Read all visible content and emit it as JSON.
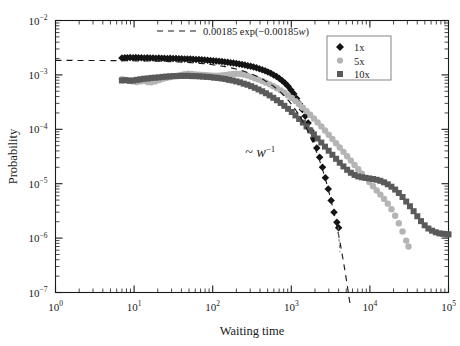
{
  "chart_data": {
    "type": "scatter",
    "title": "",
    "xlabel": "Waiting time",
    "ylabel": "Probability",
    "xscale": "log",
    "yscale": "log",
    "xlim": [
      1,
      100000
    ],
    "ylim": [
      1e-07,
      0.01
    ],
    "grid": false,
    "xticks": [
      1,
      10,
      100,
      1000,
      10000,
      100000
    ],
    "xticklabels": [
      "10^0",
      "10^1",
      "10^2",
      "10^3",
      "10^4",
      "10^5"
    ],
    "yticks": [
      1e-07,
      1e-06,
      1e-05,
      0.0001,
      0.001,
      0.01
    ],
    "yticklabels": [
      "10^-7",
      "10^-6",
      "10^-5",
      "10^-4",
      "10^-3",
      "10^-2"
    ],
    "legend_position": "top-right",
    "annotations": [
      {
        "text_tilde": "~",
        "text_var": "w",
        "text_sup": "-1",
        "x": 260,
        "y": 3.1e-05
      }
    ],
    "fit_curve": {
      "label_prefix": "0.00185",
      "label_exp": "exp(−0.00185",
      "label_var": "w",
      "label_suffix": ")",
      "amplitude": 0.00185,
      "rate": 0.00185,
      "style": "dashed",
      "color": "#1a1a1a"
    },
    "series": [
      {
        "name": "1x",
        "marker": "diamond",
        "color": "#141414",
        "points": [
          [
            7.0,
            0.00205
          ],
          [
            7.6,
            0.00207
          ],
          [
            8.2,
            0.00206
          ],
          [
            8.9,
            0.00208
          ],
          [
            9.7,
            0.00207
          ],
          [
            10.5,
            0.00209
          ],
          [
            11.4,
            0.00206
          ],
          [
            12.4,
            0.00207
          ],
          [
            13.5,
            0.00205
          ],
          [
            14.7,
            0.00206
          ],
          [
            16.0,
            0.00204
          ],
          [
            17.4,
            0.00205
          ],
          [
            18.9,
            0.00203
          ],
          [
            20.6,
            0.00204
          ],
          [
            22.4,
            0.00202
          ],
          [
            24.3,
            0.00203
          ],
          [
            26.5,
            0.00201
          ],
          [
            28.8,
            0.00202
          ],
          [
            31.3,
            0.002
          ],
          [
            34.1,
            0.002
          ],
          [
            37.1,
            0.00199
          ],
          [
            40.3,
            0.00198
          ],
          [
            43.9,
            0.00197
          ],
          [
            47.7,
            0.00196
          ],
          [
            51.9,
            0.00195
          ],
          [
            56.5,
            0.00194
          ],
          [
            61.4,
            0.00192
          ],
          [
            66.8,
            0.00191
          ],
          [
            72.7,
            0.00189
          ],
          [
            79.1,
            0.00188
          ],
          [
            86.0,
            0.00186
          ],
          [
            93.6,
            0.00184
          ],
          [
            101.8,
            0.00182
          ],
          [
            110.8,
            0.0018
          ],
          [
            120.5,
            0.00178
          ],
          [
            131.1,
            0.00176
          ],
          [
            142.6,
            0.00173
          ],
          [
            155.1,
            0.00171
          ],
          [
            168.8,
            0.00168
          ],
          [
            183.6,
            0.00165
          ],
          [
            199.7,
            0.00162
          ],
          [
            217.2,
            0.00159
          ],
          [
            236.3,
            0.00155
          ],
          [
            257.1,
            0.00152
          ],
          [
            279.6,
            0.00148
          ],
          [
            304.2,
            0.00144
          ],
          [
            330.9,
            0.0014
          ],
          [
            360.0,
            0.00135
          ],
          [
            391.6,
            0.0013
          ],
          [
            426.0,
            0.00125
          ],
          [
            463.4,
            0.00119
          ],
          [
            504.1,
            0.00113
          ],
          [
            548.4,
            0.00107
          ],
          [
            596.6,
            0.001
          ],
          [
            649.0,
            0.00093
          ],
          [
            706.0,
            0.00086
          ],
          [
            768.0,
            0.00078
          ],
          [
            835.5,
            0.0007
          ],
          [
            908.9,
            0.00062
          ],
          [
            988.7,
            0.00053
          ],
          [
            1075.5,
            0.00045
          ],
          [
            1170.0,
            0.00037
          ],
          [
            1272.8,
            0.000295
          ],
          [
            1384.6,
            0.00023
          ],
          [
            1506.2,
            0.000175
          ],
          [
            1638.5,
            0.00013
          ],
          [
            1782.4,
            9.4e-05
          ],
          [
            1938.9,
            6.6e-05
          ],
          [
            2109.2,
            4.55e-05
          ],
          [
            2294.5,
            3.05e-05
          ],
          [
            2496.0,
            2e-05
          ],
          [
            2715.3,
            1.28e-05
          ],
          [
            2953.8,
            8e-06
          ],
          [
            3213.2,
            4.9e-06
          ],
          [
            3495.4,
            3e-06
          ],
          [
            3802.4,
            1.95e-06
          ],
          [
            4000.0,
            1.55e-06
          ]
        ]
      },
      {
        "name": "5x",
        "marker": "circle",
        "color": "#b4b4b4",
        "points": [
          [
            7.0,
            0.00083
          ],
          [
            7.8,
            0.00081
          ],
          [
            8.7,
            0.00079
          ],
          [
            9.7,
            0.00076
          ],
          [
            10.8,
            0.00074
          ],
          [
            12.0,
            0.00076
          ],
          [
            13.4,
            0.00078
          ],
          [
            14.9,
            0.00074
          ],
          [
            16.6,
            0.00073
          ],
          [
            18.5,
            0.00076
          ],
          [
            20.6,
            0.0008
          ],
          [
            23.0,
            0.00084
          ],
          [
            25.6,
            0.00088
          ],
          [
            28.5,
            0.00091
          ],
          [
            31.8,
            0.00094
          ],
          [
            35.4,
            0.00097
          ],
          [
            39.5,
            0.001
          ],
          [
            44.0,
            0.00103
          ],
          [
            49.0,
            0.00105
          ],
          [
            54.6,
            0.00104
          ],
          [
            60.8,
            0.00102
          ],
          [
            67.8,
            0.00101
          ],
          [
            75.5,
            0.001
          ],
          [
            84.1,
            0.00099
          ],
          [
            93.7,
            0.00098
          ],
          [
            104.4,
            0.00097
          ],
          [
            116.4,
            0.00097
          ],
          [
            129.7,
            0.00098
          ],
          [
            144.5,
            0.001
          ],
          [
            161.0,
            0.00102
          ],
          [
            179.4,
            0.00104
          ],
          [
            199.9,
            0.00105
          ],
          [
            222.8,
            0.00104
          ],
          [
            248.2,
            0.00101
          ],
          [
            276.6,
            0.00097
          ],
          [
            308.2,
            0.00092
          ],
          [
            343.4,
            0.00087
          ],
          [
            382.7,
            0.00082
          ],
          [
            426.4,
            0.00077
          ],
          [
            475.2,
            0.00072
          ],
          [
            529.5,
            0.00067
          ],
          [
            590.0,
            0.00062
          ],
          [
            657.4,
            0.00057
          ],
          [
            732.5,
            0.00052
          ],
          [
            816.2,
            0.00047
          ],
          [
            909.5,
            0.00042
          ],
          [
            1013.4,
            0.000375
          ],
          [
            1129.2,
            0.00033
          ],
          [
            1258.1,
            0.00029
          ],
          [
            1401.9,
            0.00025
          ],
          [
            1562.1,
            0.000215
          ],
          [
            1740.5,
            0.000185
          ],
          [
            1939.4,
            0.000158
          ],
          [
            2161.0,
            0.000134
          ],
          [
            2408.0,
            0.000113
          ],
          [
            2683.1,
            9.5e-05
          ],
          [
            2989.6,
            7.95e-05
          ],
          [
            3331.2,
            6.65e-05
          ],
          [
            3711.8,
            5.55e-05
          ],
          [
            4135.9,
            4.62e-05
          ],
          [
            4608.4,
            3.85e-05
          ],
          [
            5134.8,
            3.2e-05
          ],
          [
            5721.4,
            2.66e-05
          ],
          [
            6374.9,
            2.21e-05
          ],
          [
            7103.1,
            1.84e-05
          ],
          [
            7914.4,
            1.53e-05
          ],
          [
            8818.5,
            1.28e-05
          ],
          [
            9826.2,
            1.07e-05
          ],
          [
            10948.7,
            8.95e-06
          ],
          [
            12199.5,
            7.5e-06
          ],
          [
            13593.4,
            6.3e-06
          ],
          [
            15146.8,
            5.25e-06
          ],
          [
            16877.6,
            4.3e-06
          ],
          [
            18806.1,
            3.4e-06
          ],
          [
            20954.8,
            2.58e-06
          ],
          [
            23348.9,
            1.88e-06
          ],
          [
            26016.9,
            1.32e-06
          ],
          [
            28990.5,
            9e-07
          ],
          [
            31000.0,
            7e-07
          ]
        ]
      },
      {
        "name": "10x",
        "marker": "square",
        "color": "#5a5a5a",
        "points": [
          [
            7.0,
            0.00079
          ],
          [
            7.8,
            0.0008
          ],
          [
            8.7,
            0.00078
          ],
          [
            9.7,
            0.00079
          ],
          [
            10.8,
            0.00081
          ],
          [
            12.0,
            0.00083
          ],
          [
            13.4,
            0.00085
          ],
          [
            14.9,
            0.00086
          ],
          [
            16.6,
            0.00088
          ],
          [
            18.5,
            0.00089
          ],
          [
            20.6,
            0.0009
          ],
          [
            23.0,
            0.00092
          ],
          [
            25.6,
            0.00093
          ],
          [
            28.5,
            0.00094
          ],
          [
            31.8,
            0.00095
          ],
          [
            35.4,
            0.00095
          ],
          [
            39.5,
            0.00096
          ],
          [
            44.0,
            0.00096
          ],
          [
            49.0,
            0.00096
          ],
          [
            54.6,
            0.00095
          ],
          [
            60.8,
            0.00095
          ],
          [
            67.8,
            0.00094
          ],
          [
            75.5,
            0.00093
          ],
          [
            84.1,
            0.00092
          ],
          [
            93.7,
            0.00091
          ],
          [
            104.4,
            0.00089
          ],
          [
            116.4,
            0.00088
          ],
          [
            129.7,
            0.00086
          ],
          [
            144.5,
            0.00084
          ],
          [
            161.0,
            0.00081
          ],
          [
            179.4,
            0.00079
          ],
          [
            199.9,
            0.00076
          ],
          [
            222.8,
            0.00073
          ],
          [
            248.2,
            0.00069
          ],
          [
            276.6,
            0.00066
          ],
          [
            308.2,
            0.00062
          ],
          [
            343.4,
            0.00058
          ],
          [
            382.7,
            0.00054
          ],
          [
            426.4,
            0.0005
          ],
          [
            475.2,
            0.00046
          ],
          [
            529.5,
            0.00042
          ],
          [
            590.0,
            0.00038
          ],
          [
            657.4,
            0.000342
          ],
          [
            732.5,
            0.000305
          ],
          [
            816.2,
            0.00027
          ],
          [
            909.5,
            0.000238
          ],
          [
            1013.4,
            0.000208
          ],
          [
            1129.2,
            0.00018
          ],
          [
            1258.1,
            0.000155
          ],
          [
            1401.9,
            0.000133
          ],
          [
            1562.1,
            0.000113
          ],
          [
            1740.5,
            9.55e-05
          ],
          [
            1939.4,
            8.05e-05
          ],
          [
            2161.0,
            6.78e-05
          ],
          [
            2408.0,
            5.7e-05
          ],
          [
            2683.1,
            4.8e-05
          ],
          [
            2989.6,
            4.04e-05
          ],
          [
            3331.2,
            3.4e-05
          ],
          [
            3711.8,
            2.87e-05
          ],
          [
            4135.9,
            2.43e-05
          ],
          [
            4608.4,
            2.08e-05
          ],
          [
            5134.8,
            1.8e-05
          ],
          [
            5721.4,
            1.59e-05
          ],
          [
            6374.9,
            1.45e-05
          ],
          [
            7103.1,
            1.36e-05
          ],
          [
            7914.4,
            1.31e-05
          ],
          [
            8818.5,
            1.28e-05
          ],
          [
            9826.2,
            1.25e-05
          ],
          [
            10948.7,
            1.22e-05
          ],
          [
            12199.5,
            1.18e-05
          ],
          [
            13593.4,
            1.13e-05
          ],
          [
            15146.8,
            1.06e-05
          ],
          [
            16877.6,
            9.75e-06
          ],
          [
            18806.1,
            8.8e-06
          ],
          [
            20954.8,
            7.8e-06
          ],
          [
            23348.9,
            6.75e-06
          ],
          [
            26016.9,
            5.7e-06
          ],
          [
            28990.5,
            4.7e-06
          ],
          [
            32301.9,
            3.85e-06
          ],
          [
            35991.5,
            3.12e-06
          ],
          [
            40102.8,
            2.52e-06
          ],
          [
            44684.5,
            2.05e-06
          ],
          [
            49790.7,
            1.72e-06
          ],
          [
            55481.8,
            1.5e-06
          ],
          [
            61824.4,
            1.37e-06
          ],
          [
            68892.8,
            1.28e-06
          ],
          [
            76769.9,
            1.22e-06
          ],
          [
            85547.8,
            1.2e-06
          ],
          [
            95329.1,
            1.18e-06
          ],
          [
            100000.0,
            1.17e-06
          ]
        ]
      }
    ]
  },
  "legend": {
    "items": [
      {
        "label": "1x",
        "marker": "diamond",
        "color": "#141414"
      },
      {
        "label": "5x",
        "marker": "circle",
        "color": "#b4b4b4"
      },
      {
        "label": "10x",
        "marker": "square",
        "color": "#5a5a5a"
      }
    ]
  }
}
